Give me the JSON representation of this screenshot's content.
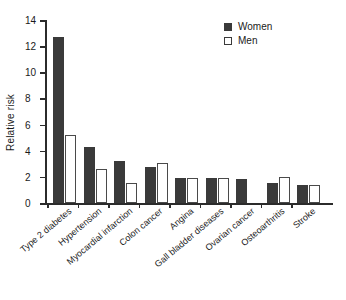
{
  "chart_data": {
    "type": "bar",
    "title": "",
    "xlabel": "",
    "ylabel": "Relative risk",
    "ylim": [
      0,
      14
    ],
    "yticks": [
      0,
      2,
      4,
      6,
      8,
      10,
      12,
      14
    ],
    "grid": false,
    "legend_position": "top-right",
    "categories": [
      "Type 2 diabetes",
      "Hypertension",
      "Myocardial infarction",
      "Colon cancer",
      "Angina",
      "Gall bladder diseases",
      "Ovarian cancer",
      "Osteoarthritis",
      "Stroke"
    ],
    "series": [
      {
        "name": "Women",
        "color": "#3a3a3a",
        "values": [
          12.7,
          4.25,
          3.25,
          2.75,
          1.9,
          1.9,
          1.8,
          1.5,
          1.4
        ]
      },
      {
        "name": "Men",
        "color": "#ffffff",
        "values": [
          5.2,
          2.6,
          1.55,
          3.05,
          1.9,
          1.9,
          null,
          2.0,
          1.4
        ]
      }
    ]
  },
  "legend": {
    "items": [
      {
        "label": "Women",
        "swatch": "filled-square-icon"
      },
      {
        "label": "Men",
        "swatch": "outlined-square-icon"
      }
    ]
  },
  "axis": {
    "y_title": "Relative risk",
    "y_tick_labels": [
      "0",
      "2",
      "4",
      "6",
      "8",
      "10",
      "12",
      "14"
    ]
  }
}
